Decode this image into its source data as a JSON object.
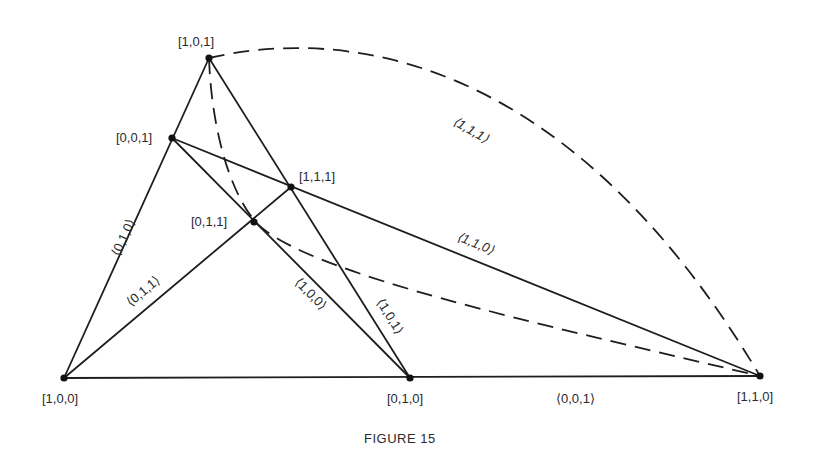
{
  "figure": {
    "caption": "FIGURE 15",
    "points": [
      {
        "id": "p101",
        "label": "[1,0,1]"
      },
      {
        "id": "p001",
        "label": "[0,0,1]"
      },
      {
        "id": "p111",
        "label": "[1,1,1]"
      },
      {
        "id": "p011",
        "label": "[0,1,1]"
      },
      {
        "id": "p100",
        "label": "[1,0,0]"
      },
      {
        "id": "p010",
        "label": "[0,1,0]"
      },
      {
        "id": "p110",
        "label": "[1,1,0]"
      }
    ],
    "lines": [
      {
        "id": "l010",
        "label": "⟨0,1,0⟩",
        "style": "solid",
        "through": [
          "[1,0,0]",
          "[0,0,1]",
          "[1,0,1]"
        ]
      },
      {
        "id": "l011",
        "label": "⟨0,1,1⟩",
        "style": "solid",
        "through": [
          "[1,0,0]",
          "[0,1,1]",
          "[1,1,1]"
        ]
      },
      {
        "id": "l100",
        "label": "⟨1,0,0⟩",
        "style": "solid",
        "through": [
          "[0,0,1]",
          "[0,1,1]",
          "[0,1,0]"
        ]
      },
      {
        "id": "l101",
        "label": "⟨1,0,1⟩",
        "style": "solid",
        "through": [
          "[1,0,1]",
          "[1,1,1]",
          "[0,1,0]"
        ]
      },
      {
        "id": "l110",
        "label": "⟨1,1,0⟩",
        "style": "solid",
        "through": [
          "[0,0,1]",
          "[1,1,1]",
          "[1,1,0]"
        ]
      },
      {
        "id": "l001",
        "label": "⟨0,0,1⟩",
        "style": "solid",
        "through": [
          "[1,0,0]",
          "[0,1,0]",
          "[1,1,0]"
        ]
      },
      {
        "id": "l111",
        "label": "⟨1,1,1⟩",
        "style": "dashed",
        "through": [
          "[1,0,1]",
          "[0,1,1]",
          "[1,1,0]"
        ]
      }
    ]
  }
}
